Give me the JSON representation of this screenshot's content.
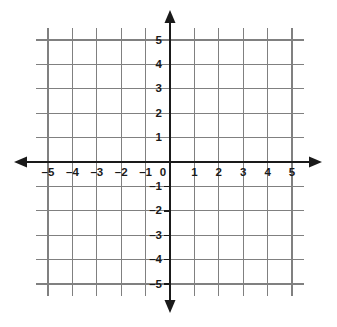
{
  "chart_data": {
    "type": "scatter",
    "title": "",
    "subtitle": "",
    "xlabel": "",
    "ylabel": "",
    "xlim": [
      -5,
      5
    ],
    "ylim": [
      -5,
      5
    ],
    "grid": true,
    "legend": null,
    "series": [],
    "x_tick_labels": [
      "–5",
      "–4",
      "–3",
      "–2",
      "–1",
      "0",
      "1",
      "2",
      "3",
      "4",
      "5"
    ],
    "x_tick_values": [
      -5,
      -4,
      -3,
      -2,
      -1,
      0,
      1,
      2,
      3,
      4,
      5
    ],
    "y_tick_labels": [
      "5",
      "4",
      "3",
      "2",
      "1",
      "–1",
      "–2",
      "–3",
      "–4",
      "–5"
    ],
    "y_tick_values": [
      5,
      4,
      3,
      2,
      1,
      -1,
      -2,
      -3,
      -4,
      -5
    ],
    "origin_label": "0",
    "annotations": [],
    "colors": {
      "grid": "#808080",
      "axis": "#1a1a1a",
      "background": "#ffffff",
      "label": "#1a1a1a"
    }
  },
  "graph": {
    "x_labels": [
      {
        "text": "–5",
        "value": -5
      },
      {
        "text": "–4",
        "value": -4
      },
      {
        "text": "–3",
        "value": -3
      },
      {
        "text": "–2",
        "value": -2
      },
      {
        "text": "–1",
        "value": -1
      },
      {
        "text": "1",
        "value": 1
      },
      {
        "text": "2",
        "value": 2
      },
      {
        "text": "3",
        "value": 3
      },
      {
        "text": "4",
        "value": 4
      },
      {
        "text": "5",
        "value": 5
      }
    ],
    "y_labels": [
      {
        "text": "5",
        "value": 5
      },
      {
        "text": "4",
        "value": 4
      },
      {
        "text": "3",
        "value": 3
      },
      {
        "text": "2",
        "value": 2
      },
      {
        "text": "1",
        "value": 1
      },
      {
        "text": "–1",
        "value": -1
      },
      {
        "text": "–2",
        "value": -2
      },
      {
        "text": "–3",
        "value": -3
      },
      {
        "text": "–4",
        "value": -4
      },
      {
        "text": "–5",
        "value": -5
      }
    ],
    "origin_label": "0"
  }
}
